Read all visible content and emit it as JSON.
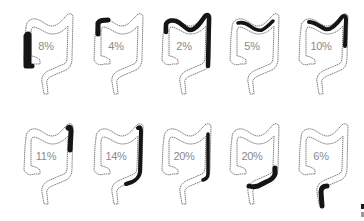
{
  "figure": {
    "rows": [
      {
        "items": [
          {
            "label": "8%",
            "segment": "cecum-ascending",
            "x": 12,
            "y": 6
          },
          {
            "label": "4%",
            "segment": "hepatic-flexure",
            "x": 82,
            "y": 6
          },
          {
            "label": "2%",
            "segment": "transverse-and-descending",
            "x": 150,
            "y": 6
          },
          {
            "label": "5%",
            "segment": "transverse",
            "x": 218,
            "y": 6
          },
          {
            "label": "10%",
            "segment": "distal-transverse-splenic-flexure",
            "x": 287,
            "y": 6
          }
        ]
      },
      {
        "items": [
          {
            "label": "11%",
            "segment": "splenic-flexure",
            "x": 12,
            "y": 116
          },
          {
            "label": "14%",
            "segment": "descending",
            "x": 82,
            "y": 116
          },
          {
            "label": "20%",
            "segment": "descending-lower",
            "x": 150,
            "y": 116
          },
          {
            "label": "20%",
            "segment": "sigmoid",
            "x": 218,
            "y": 116
          },
          {
            "label": "6%",
            "segment": "rectum",
            "x": 287,
            "y": 116
          }
        ]
      }
    ],
    "colors": {
      "highlight": "#151515",
      "outline": "#6e6e6e",
      "label": "#8a8a8a",
      "background": "#ffffff"
    }
  }
}
